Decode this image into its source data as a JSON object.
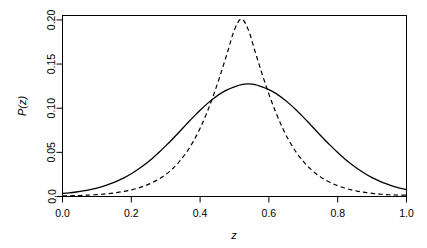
{
  "chart_data": {
    "type": "line",
    "title": "",
    "subtitle": "",
    "xlabel": "z",
    "ylabel": "P(z)",
    "xlim": [
      0.0,
      1.0
    ],
    "ylim": [
      0.0,
      0.205
    ],
    "grid": false,
    "legend": "none",
    "background": "#ffffff",
    "foreground": "#000000",
    "frame": "box",
    "xticks": [
      0.0,
      0.2,
      0.4,
      0.6,
      0.8,
      1.0
    ],
    "xtick_labels": [
      "0.0",
      "0.2",
      "0.4",
      "0.6",
      "0.8",
      "1.0"
    ],
    "yticks": [
      0.0,
      0.05,
      0.1,
      0.15,
      0.2
    ],
    "ytick_labels": [
      "0.0",
      "0.05",
      "0.10",
      "0.15",
      "0.20"
    ],
    "x": [
      0.0,
      0.02,
      0.04,
      0.06,
      0.08,
      0.1,
      0.12,
      0.14,
      0.16,
      0.18,
      0.2,
      0.22,
      0.24,
      0.26,
      0.28,
      0.3,
      0.32,
      0.34,
      0.36,
      0.38,
      0.4,
      0.42,
      0.44,
      0.46,
      0.48,
      0.5,
      0.52,
      0.54,
      0.56,
      0.58,
      0.6,
      0.62,
      0.64,
      0.66,
      0.68,
      0.7,
      0.72,
      0.74,
      0.76,
      0.78,
      0.8,
      0.82,
      0.84,
      0.86,
      0.88,
      0.9,
      0.92,
      0.94,
      0.96,
      0.98,
      1.0
    ],
    "series": [
      {
        "name": "solid-curve",
        "style": "solid",
        "color": "#000000",
        "peak_x": 0.51,
        "peak_y": 0.128,
        "values": [
          0.0034,
          0.0041,
          0.0051,
          0.0063,
          0.0078,
          0.0096,
          0.0118,
          0.0145,
          0.0177,
          0.0214,
          0.0258,
          0.0308,
          0.0365,
          0.0428,
          0.0498,
          0.0573,
          0.0652,
          0.0734,
          0.0817,
          0.0899,
          0.0977,
          0.1049,
          0.1113,
          0.1168,
          0.1211,
          0.1242,
          0.1268,
          0.1275,
          0.1268,
          0.1242,
          0.1211,
          0.1168,
          0.1113,
          0.1049,
          0.0977,
          0.0899,
          0.0817,
          0.0734,
          0.0652,
          0.0573,
          0.0498,
          0.0428,
          0.0365,
          0.0308,
          0.0258,
          0.0214,
          0.0177,
          0.0145,
          0.0118,
          0.0096,
          0.0078
        ]
      },
      {
        "name": "dashed-curve",
        "style": "dashed",
        "color": "#000000",
        "peak_x": 0.5,
        "peak_y": 0.201,
        "values": [
          0.0006,
          0.0008,
          0.001,
          0.0013,
          0.0017,
          0.0022,
          0.0028,
          0.0036,
          0.0046,
          0.0059,
          0.0075,
          0.0096,
          0.0122,
          0.0155,
          0.0197,
          0.0249,
          0.0315,
          0.0397,
          0.0498,
          0.0622,
          0.0773,
          0.0952,
          0.1159,
          0.1391,
          0.164,
          0.189,
          0.201,
          0.189,
          0.164,
          0.1391,
          0.1159,
          0.0952,
          0.0773,
          0.0622,
          0.0498,
          0.0397,
          0.0315,
          0.0249,
          0.0197,
          0.0155,
          0.0122,
          0.0096,
          0.0075,
          0.0059,
          0.0046,
          0.0036,
          0.0028,
          0.0022,
          0.0018,
          0.0016,
          0.0015
        ]
      }
    ],
    "annotations": []
  }
}
